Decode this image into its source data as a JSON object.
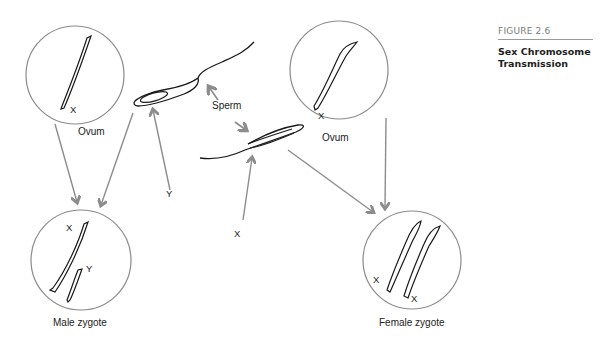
{
  "figure": {
    "number": "FIGURE 2.6",
    "title_line1": "Sex Chromosome",
    "title_line2": "Transmission"
  },
  "labels": {
    "ovum_left": "Ovum",
    "ovum_right": "Ovum",
    "ovum_left_chromosome": "X",
    "ovum_right_chromosome": "X",
    "sperm": "Sperm",
    "sperm_top_chromosome": "Y",
    "sperm_bottom_chromosome": "X",
    "male_zygote": "Male zygote",
    "male_x": "X",
    "male_y": "Y",
    "female_zygote": "Female zygote",
    "female_x1": "X",
    "female_x2": "X"
  },
  "colors": {
    "circle_stroke": "#8a8a8a",
    "arrow": "#8c8c8c",
    "line": "#1a1a1a"
  }
}
